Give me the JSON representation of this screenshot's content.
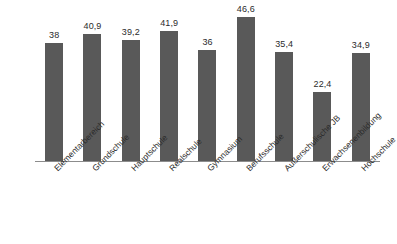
{
  "chart_data": {
    "type": "bar",
    "title": "",
    "subtitle": "",
    "xlabel": "",
    "ylabel": "",
    "grid": false,
    "legend": false,
    "legend_position": "none",
    "ylim": [
      0,
      50
    ],
    "bar_color": "#595959",
    "axis_color": "#8c8c8c",
    "label_color": "#2b2b2b",
    "decimal_separator": ",",
    "categories": [
      "Elementarbereich",
      "Grundschule",
      "Hauptschule",
      "Realschule",
      "Gymnasium",
      "Berufsschule",
      "Außerschulische JB",
      "Erwachsenenbildung",
      "Hochschule"
    ],
    "values": [
      38,
      40.9,
      39.2,
      41.9,
      36,
      46.6,
      35.4,
      22.4,
      34.9
    ],
    "value_labels": [
      "38",
      "40,9",
      "39,2",
      "41,9",
      "36",
      "46,6",
      "35,4",
      "22,4",
      "34,9"
    ]
  }
}
